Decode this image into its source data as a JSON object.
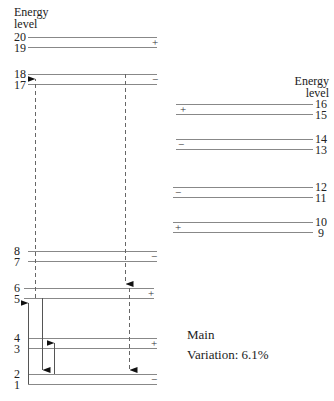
{
  "diagram": {
    "left_axis_title_line1": "Energy",
    "left_axis_title_line2": "level",
    "right_axis_title_line1": "Energy",
    "right_axis_title_line2": "level",
    "left_levels": [
      {
        "n": "20",
        "y": 37
      },
      {
        "n": "19",
        "y": 47
      },
      {
        "n": "18",
        "y": 74
      },
      {
        "n": "17",
        "y": 84
      },
      {
        "n": "8",
        "y": 251
      },
      {
        "n": "7",
        "y": 261
      },
      {
        "n": "6",
        "y": 288
      },
      {
        "n": "5",
        "y": 298
      },
      {
        "n": "4",
        "y": 338
      },
      {
        "n": "3",
        "y": 348
      },
      {
        "n": "2",
        "y": 374
      },
      {
        "n": "1",
        "y": 384
      }
    ],
    "right_levels": [
      {
        "n": "16",
        "y": 104
      },
      {
        "n": "15",
        "y": 114
      },
      {
        "n": "14",
        "y": 139
      },
      {
        "n": "13",
        "y": 149
      },
      {
        "n": "12",
        "y": 187
      },
      {
        "n": "11",
        "y": 197
      },
      {
        "n": "10",
        "y": 222
      },
      {
        "n": "9",
        "y": 232
      }
    ],
    "parity_signs": {
      "pair_20_19": "+",
      "pair_18_17": "−",
      "pair_16_15": "+",
      "pair_14_13": "−",
      "pair_12_11": "−",
      "pair_10_9": "+",
      "pair_8_7": "−",
      "pair_6_5": "+",
      "pair_4_3": "+",
      "pair_2_1": "−"
    },
    "transitions": [
      {
        "from": "1",
        "to": "5",
        "style": "solid",
        "direction": "up"
      },
      {
        "from": "5",
        "to": "2",
        "style": "solid",
        "direction": "down"
      },
      {
        "from": "2",
        "to": "4",
        "style": "solid",
        "direction": "up"
      },
      {
        "from": "5",
        "to": "18",
        "style": "dashed",
        "direction": "up"
      },
      {
        "from": "17",
        "to": "6",
        "style": "dashed",
        "direction": "down"
      },
      {
        "from": "6",
        "to": "2",
        "style": "dashed",
        "direction": "down"
      }
    ],
    "annotation_title": "Main",
    "annotation_variation": "Variation: 6.1%"
  }
}
